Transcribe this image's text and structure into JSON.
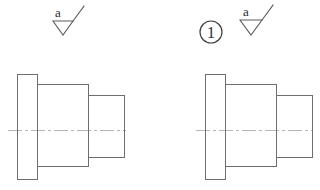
{
  "drawing": {
    "title": "Stepped bushing — two views with surface finish symbols",
    "background_color": "#ffffff",
    "line_color": "#6e6e70",
    "centerline_color": "#b9b3b6",
    "text_color": "#2c2c2e",
    "view_count": 2
  },
  "annotations": {
    "finish_symbol_left": {
      "label": "a",
      "icon": "surface-finish-triangle-icon",
      "meaning": "surface roughness symbol"
    },
    "finish_symbol_right": {
      "label": "a",
      "icon": "surface-finish-triangle-icon",
      "meaning": "surface roughness symbol"
    },
    "balloon": {
      "label": "1",
      "icon": "item-balloon-circle-icon",
      "meaning": "item callout number"
    }
  },
  "views": [
    {
      "name": "view-left",
      "centerline": {
        "y": 130,
        "x_start": 8,
        "x_end": 126
      },
      "steps": [
        {
          "name": "flange",
          "x": 17,
          "y": 74,
          "width": 20,
          "height": 105
        },
        {
          "name": "body",
          "x": 37,
          "y": 84,
          "width": 51,
          "height": 82
        },
        {
          "name": "boss",
          "x": 88,
          "y": 95,
          "width": 36,
          "height": 62
        }
      ]
    },
    {
      "name": "view-right",
      "centerline": {
        "y": 130,
        "x_start": 196,
        "x_end": 313
      },
      "steps": [
        {
          "name": "flange",
          "x": 205,
          "y": 74,
          "width": 20,
          "height": 105
        },
        {
          "name": "body",
          "x": 225,
          "y": 84,
          "width": 51,
          "height": 82
        },
        {
          "name": "boss",
          "x": 276,
          "y": 95,
          "width": 36,
          "height": 62
        }
      ]
    }
  ]
}
